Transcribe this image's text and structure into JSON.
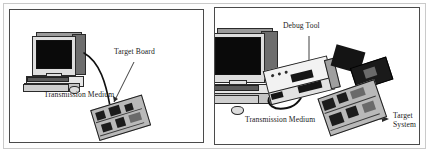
{
  "figure": {
    "title": "",
    "panel_count": 2,
    "colors": {
      "ink": "#1a1a1a",
      "panel_border": "#4a4a4a",
      "outer_frame": "#c9c9c9",
      "background": "#ffffff",
      "screen": "#0a0a0a",
      "cable": "#101010"
    }
  },
  "panels": [
    {
      "id": "left",
      "name": "direct-connection-setup",
      "labels": {
        "target_board": "Target Board",
        "transmission_medium": "Transmission Medium"
      },
      "objects": {
        "host_computer": "host-computer",
        "target_board": "target-board-pcb"
      }
    },
    {
      "id": "right",
      "name": "debug-tool-setup",
      "labels": {
        "debug_tool": "Debug Tool",
        "transmission_medium": "Transmission Medium",
        "target_system_line1": "Target",
        "target_system_line2": "System"
      },
      "objects": {
        "host_computer": "host-computer",
        "debug_tool": "debug-tool-box",
        "ribbon_cable": "ribbon-cable",
        "target_system": "target-system-pcb"
      }
    }
  ]
}
